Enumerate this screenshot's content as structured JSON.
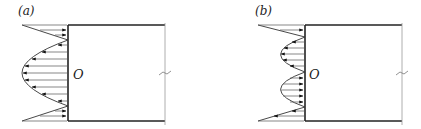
{
  "panels": [
    {
      "id": "a",
      "label": "(a)",
      "origin_label": "O",
      "description": "Stress distribution on left edge: end triangles pointing toward wall, single parabolic lobe pointing away (leftward)",
      "geometry": {
        "wall_x": 68,
        "top_y": 25,
        "bottom_y": 121,
        "right_x": 165,
        "mid_y": 73,
        "triangle_far_x": 22,
        "lobe_peak_x": 22
      },
      "lobes": [
        {
          "type": "triangle-top",
          "direction": "right",
          "from_y": 25,
          "to_y": 40
        },
        {
          "type": "parabola",
          "direction": "left",
          "from_y": 40,
          "to_y": 106
        },
        {
          "type": "triangle-bottom",
          "direction": "right",
          "from_y": 106,
          "to_y": 121
        }
      ]
    },
    {
      "id": "b",
      "label": "(b)",
      "origin_label": "O",
      "description": "Stress distribution on left edge: end triangles, upper lobe pointing left, lower lobe pointing right (antisymmetric)",
      "geometry": {
        "wall_x": 305,
        "top_y": 25,
        "bottom_y": 121,
        "right_x": 402,
        "mid_y": 73,
        "triangle_far_x": 258,
        "lobe_peak_x": 280
      },
      "lobes": [
        {
          "type": "triangle-top",
          "direction": "right",
          "from_y": 25,
          "to_y": 37
        },
        {
          "type": "parabola",
          "direction": "left",
          "from_y": 37,
          "to_y": 72
        },
        {
          "type": "parabola",
          "direction": "right",
          "from_y": 72,
          "to_y": 107
        },
        {
          "type": "triangle-bottom",
          "direction": "left",
          "from_y": 107,
          "to_y": 121
        }
      ]
    }
  ],
  "colors": {
    "line": "#222222",
    "arrow_line": "#555555",
    "edge_thin": "#999999"
  }
}
